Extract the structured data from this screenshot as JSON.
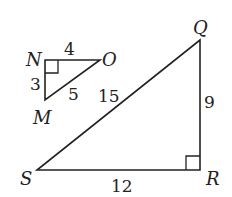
{
  "diagram": {
    "type": "similar right triangles",
    "triangles": [
      {
        "name": "MNO",
        "vertices": {
          "N": {
            "label": "N",
            "x": 45,
            "y": 60
          },
          "O": {
            "label": "O",
            "x": 100,
            "y": 60
          },
          "M": {
            "label": "M",
            "x": 45,
            "y": 100
          }
        },
        "right_angle_at": "N",
        "sides": {
          "NO": "4",
          "NM": "3",
          "MO": "5"
        }
      },
      {
        "name": "QRS",
        "vertices": {
          "Q": {
            "label": "Q",
            "x": 200,
            "y": 40
          },
          "R": {
            "label": "R",
            "x": 200,
            "y": 170
          },
          "S": {
            "label": "S",
            "x": 37,
            "y": 170
          }
        },
        "right_angle_at": "R",
        "sides": {
          "SQ": "15",
          "QR": "9",
          "SR": "12"
        }
      }
    ],
    "stroke_color": "#222222",
    "background": "#ffffff"
  }
}
